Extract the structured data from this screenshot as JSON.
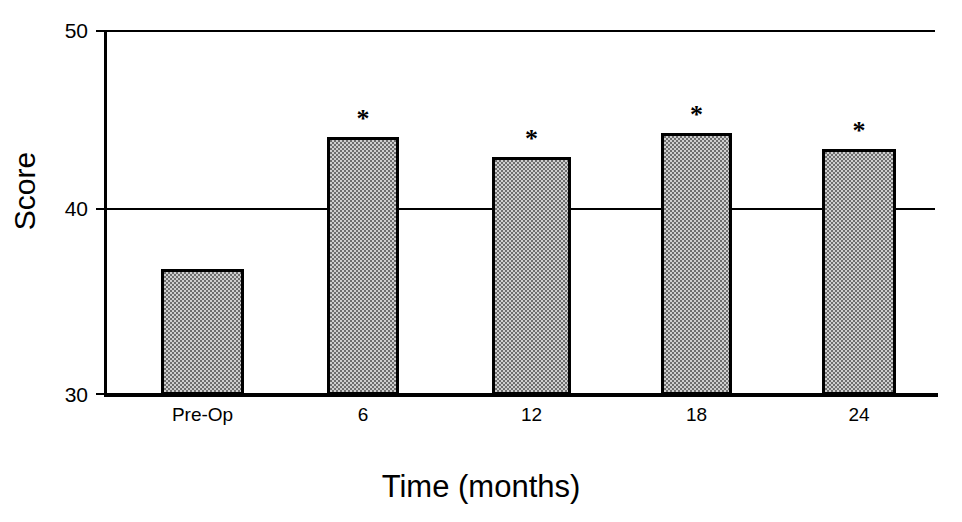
{
  "chart_data": {
    "type": "bar",
    "title": "",
    "xlabel": "Time (months)",
    "ylabel": "Score",
    "categories": [
      "Pre-Op",
      "6",
      "12",
      "18",
      "24"
    ],
    "values": [
      36.9,
      44.2,
      43.1,
      44.4,
      43.5
    ],
    "annotations": [
      "",
      "*",
      "*",
      "*",
      "*"
    ],
    "ylim": [
      30,
      50
    ],
    "yticks": [
      "30",
      "40",
      "50"
    ],
    "ytick_values": [
      30,
      40,
      50
    ],
    "grid": "horizontal gridlines at 40 and 50",
    "legend": "none",
    "bar_fill_color": "#9a9a9a",
    "bar_edge_color": "#000000",
    "background_color": "#ffffff",
    "note": "Asterisks mark values significantly different from Pre-Op baseline"
  },
  "axis": {
    "y_title": "Score",
    "x_title": "Time (months)",
    "y_tick_50": "50",
    "y_tick_40": "40",
    "y_tick_30": "30"
  },
  "bars": [
    {
      "label": "Pre-Op",
      "value": 36.9,
      "star": ""
    },
    {
      "label": "6",
      "value": 44.2,
      "star": "*"
    },
    {
      "label": "12",
      "value": 43.1,
      "star": "*"
    },
    {
      "label": "18",
      "value": 44.4,
      "star": "*"
    },
    {
      "label": "24",
      "value": 43.5,
      "star": "*"
    }
  ]
}
